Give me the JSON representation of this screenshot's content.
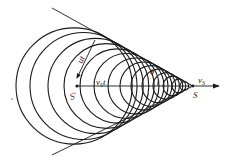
{
  "diagram": {
    "colors": {
      "stroke": "#1a1a1a",
      "background": "#ffffff"
    },
    "apex": {
      "x": 193,
      "y": 86
    },
    "axis": {
      "x1": 77,
      "x2": 219,
      "y": 86
    },
    "cone_lines": [
      {
        "x1": 52,
        "y1": 8,
        "x2": 193,
        "y2": 86
      },
      {
        "x1": 52,
        "y1": 155,
        "x2": 193,
        "y2": 86
      }
    ],
    "circles": [
      {
        "cx": 74.1,
        "r": 58.1
      },
      {
        "cx": 83.5,
        "r": 53.5
      },
      {
        "cx": 95.6,
        "r": 47.6
      },
      {
        "cx": 106.4,
        "r": 42.4
      },
      {
        "cx": 117.1,
        "r": 37.1
      },
      {
        "cx": 126.5,
        "r": 32.5
      },
      {
        "cx": 136.0,
        "r": 28.0
      },
      {
        "cx": 144.0,
        "r": 24.0
      },
      {
        "cx": 151.4,
        "r": 20.4
      },
      {
        "cx": 158.8,
        "r": 16.8
      },
      {
        "cx": 166.2,
        "r": 13.2
      },
      {
        "cx": 172.9,
        "r": 9.9
      },
      {
        "cx": 178.9,
        "r": 6.9
      },
      {
        "cx": 184.3,
        "r": 4.3
      }
    ],
    "labels": {
      "wave_radius": "ut",
      "source_distance": "vSt",
      "source_distance_main": "v",
      "source_distance_sub": "S",
      "source_distance_tail": "t",
      "angle": "θ",
      "velocity_main": "v",
      "velocity_sub": "S",
      "source": "S",
      "earlier_source": "S'"
    }
  }
}
